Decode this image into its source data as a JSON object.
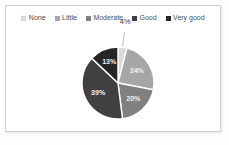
{
  "chart_data": {
    "type": "pie",
    "title": "",
    "subtitle": "",
    "xlabel": "",
    "ylabel": "",
    "legend_position": "top",
    "grid": false,
    "categories": [
      "None",
      "Little",
      "Moderate",
      "Good",
      "Very good"
    ],
    "values": [
      4,
      24,
      20,
      39,
      13
    ],
    "value_labels": [
      "4%",
      "24%",
      "20%",
      "39%",
      "13%"
    ],
    "units": "percent",
    "total": 100,
    "colors": [
      "#d9d9d9",
      "#a6a6a6",
      "#808080",
      "#404040",
      "#262626"
    ],
    "slices": [
      {
        "label": "None",
        "value": 4,
        "display": "4%",
        "color": "#d9d9d9",
        "label_placement": "outside"
      },
      {
        "label": "Little",
        "value": 24,
        "display": "24%",
        "color": "#a6a6a6",
        "label_placement": "inside"
      },
      {
        "label": "Moderate",
        "value": 20,
        "display": "20%",
        "color": "#808080",
        "label_placement": "inside"
      },
      {
        "label": "Good",
        "value": 39,
        "display": "39%",
        "color": "#404040",
        "label_placement": "inside"
      },
      {
        "label": "Very good",
        "value": 13,
        "display": "13%",
        "color": "#262626",
        "label_placement": "inside"
      }
    ]
  },
  "legend": {
    "items": [
      {
        "label": "None",
        "color": "#d9d9d9"
      },
      {
        "label": "Little",
        "color": "#a6a6a6"
      },
      {
        "label": "Moderate",
        "color": "#808080"
      },
      {
        "label": "Good",
        "color": "#404040"
      },
      {
        "label": "Very good",
        "color": "#262626"
      }
    ]
  },
  "style": {
    "frame_border_color": "#cfcfcf",
    "page_background": "#fdfdfd",
    "plot_background": "#ffffff",
    "slice_separator_color": "#ffffff",
    "inside_label_color": "#f2f2f2",
    "outside_label_color": "#3f3f3f"
  }
}
